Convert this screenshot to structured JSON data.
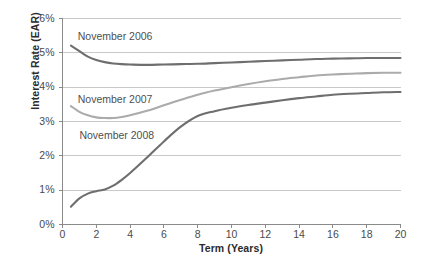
{
  "chart_data": {
    "type": "line",
    "title": "",
    "xlabel": "Term (Years)",
    "ylabel": "Interest Rate (EAR)",
    "xlim": [
      0,
      20
    ],
    "ylim": [
      0,
      6
    ],
    "grid": true,
    "legend_position": "inline-annotations",
    "xticks": [
      0,
      2,
      4,
      6,
      8,
      10,
      12,
      14,
      16,
      18,
      20
    ],
    "xtick_labels": [
      "0",
      "2",
      "4",
      "6",
      "8",
      "10",
      "12",
      "14",
      "16",
      "18",
      "20"
    ],
    "yticks": [
      0,
      1,
      2,
      3,
      4,
      5,
      6
    ],
    "ytick_labels": [
      "0%",
      "1%",
      "2%",
      "3%",
      "4%",
      "5%",
      "6%"
    ],
    "x": [
      0.5,
      1,
      1.5,
      2,
      2.5,
      3,
      3.5,
      4,
      5,
      6,
      7,
      8,
      9,
      10,
      11,
      12,
      13,
      14,
      15,
      16,
      17,
      18,
      19,
      20
    ],
    "series": [
      {
        "name": "November 2006",
        "color": "#6e6e6e",
        "values": [
          5.21,
          5.05,
          4.89,
          4.79,
          4.73,
          4.69,
          4.67,
          4.66,
          4.65,
          4.66,
          4.67,
          4.68,
          4.7,
          4.72,
          4.74,
          4.76,
          4.78,
          4.8,
          4.82,
          4.83,
          4.84,
          4.85,
          4.85,
          4.85
        ]
      },
      {
        "name": "November 2007",
        "color": "#ababab",
        "values": [
          3.45,
          3.28,
          3.18,
          3.12,
          3.1,
          3.1,
          3.13,
          3.18,
          3.31,
          3.47,
          3.63,
          3.78,
          3.9,
          4.0,
          4.09,
          4.17,
          4.24,
          4.29,
          4.34,
          4.37,
          4.39,
          4.41,
          4.42,
          4.42
        ]
      },
      {
        "name": "November 2008",
        "color": "#6e6e6e",
        "values": [
          0.52,
          0.76,
          0.9,
          0.97,
          1.02,
          1.13,
          1.3,
          1.5,
          1.95,
          2.42,
          2.85,
          3.16,
          3.3,
          3.4,
          3.48,
          3.55,
          3.62,
          3.68,
          3.73,
          3.78,
          3.81,
          3.83,
          3.85,
          3.86
        ]
      }
    ],
    "annotations": [
      {
        "text": "November 2006",
        "x": 0.9,
        "y": 5.45
      },
      {
        "text": "November 2007",
        "x": 0.9,
        "y": 3.62
      },
      {
        "text": "November 2008",
        "x": 1.0,
        "y": 2.58
      }
    ]
  },
  "colors": {
    "axis": "#8a8a8a",
    "grid": "#c9c9c9",
    "text": "#4a4a4a",
    "title_text": "#2b2b2b",
    "line_dark": "#6e6e6e",
    "line_light": "#ababab",
    "background": "#ffffff"
  }
}
